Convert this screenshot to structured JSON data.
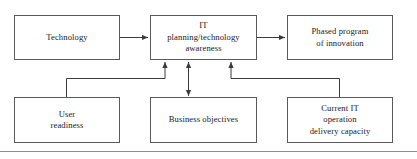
{
  "figure": {
    "type": "flow-diagram",
    "background_color": "#ffffff",
    "box_border_color": "#5a5a5a",
    "connector_color": "#3a3a3a",
    "text_color": "#1a1a1a",
    "rule_color": "#8e8e8e"
  },
  "nodes": {
    "technology": {
      "id": "technology",
      "lines": [
        "Technology"
      ]
    },
    "it_planning": {
      "id": "it-planning-technology-awareness",
      "lines": [
        "IT",
        "planning/technology",
        "awareness"
      ]
    },
    "phased_program": {
      "id": "phased-program-of-innovation",
      "lines": [
        "Phased program",
        "of innovation"
      ]
    },
    "user_readiness": {
      "id": "user-readiness",
      "lines": [
        "User",
        "readiness"
      ]
    },
    "business_objectives": {
      "id": "business-objectives",
      "lines": [
        "Business objectives"
      ]
    },
    "current_it": {
      "id": "current-it-operation-delivery-capacity",
      "lines": [
        "Current IT",
        "operation",
        "delivery capacity"
      ]
    }
  },
  "connectors": [
    {
      "name": "technology-to-it-planning",
      "from": "technology",
      "to": "it_planning",
      "direction": "one-way",
      "arrow_at": "it_planning"
    },
    {
      "name": "it-planning-to-phased-program",
      "from": "it_planning",
      "to": "phased_program",
      "direction": "one-way",
      "arrow_at": "phased_program"
    },
    {
      "name": "user-readiness-to-it-planning",
      "from": "user_readiness",
      "to": "it_planning",
      "direction": "one-way",
      "arrow_at": "it_planning"
    },
    {
      "name": "business-objectives-and-it-planning",
      "from": "it_planning",
      "to": "business_objectives",
      "direction": "two-way",
      "arrow_at": "both"
    },
    {
      "name": "current-it-to-it-planning",
      "from": "current_it",
      "to": "it_planning",
      "direction": "one-way",
      "arrow_at": "it_planning"
    }
  ]
}
